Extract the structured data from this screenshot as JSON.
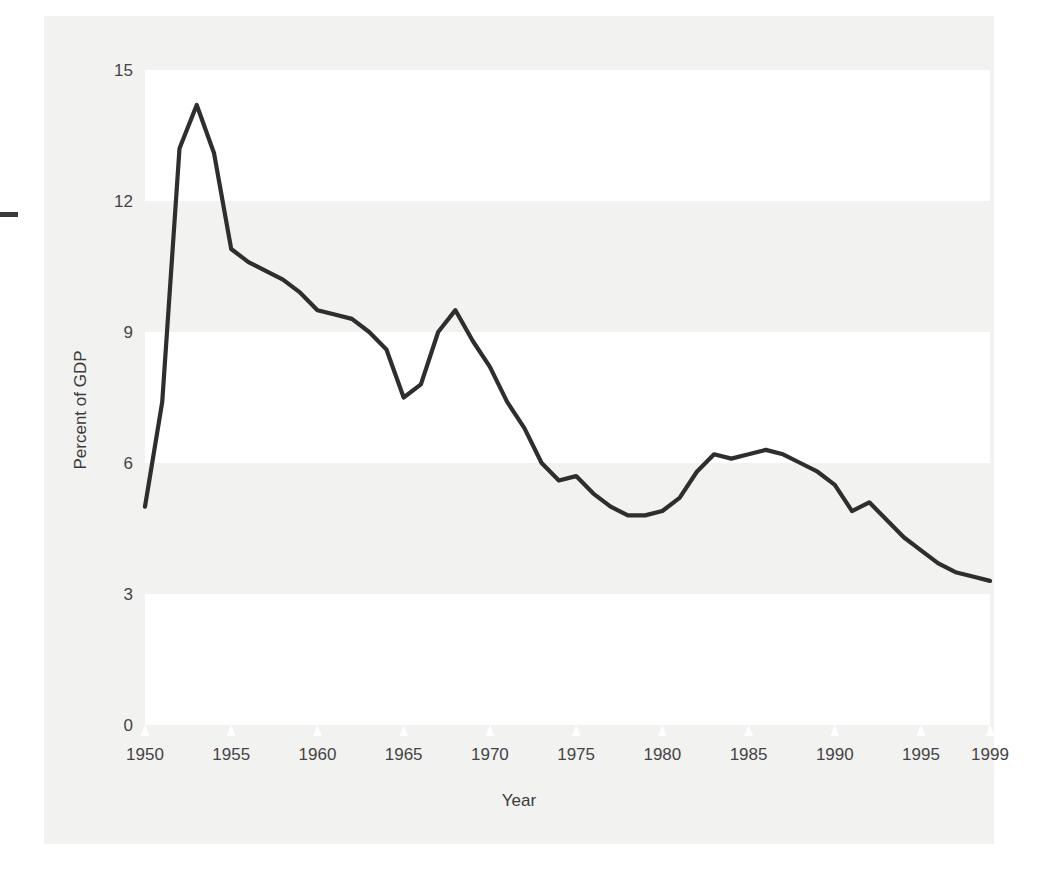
{
  "chart_data": {
    "type": "line",
    "title": "",
    "xlabel": "Year",
    "ylabel": "Percent of GDP",
    "xlim": [
      1950,
      1999
    ],
    "ylim": [
      0,
      15
    ],
    "ytick_values": [
      0,
      3,
      6,
      9,
      12,
      15
    ],
    "ytick_labels": [
      "0",
      "3",
      "6",
      "9",
      "12",
      "15"
    ],
    "xtick_values": [
      1950,
      1955,
      1960,
      1965,
      1970,
      1975,
      1980,
      1985,
      1990,
      1995,
      1999
    ],
    "xtick_labels": [
      "1950",
      "1955",
      "1960",
      "1965",
      "1970",
      "1975",
      "1980",
      "1985",
      "1990",
      "1995",
      "1999"
    ],
    "grid": false,
    "banded_background": true,
    "band_ranges": [
      [
        12,
        15
      ],
      [
        6,
        9
      ],
      [
        0,
        3
      ]
    ],
    "legend": null,
    "series": [
      {
        "name": "Defense spending as percent of GDP",
        "color": "#2e2e2e",
        "x": [
          1950,
          1951,
          1952,
          1953,
          1954,
          1955,
          1956,
          1957,
          1958,
          1959,
          1960,
          1961,
          1962,
          1963,
          1964,
          1965,
          1966,
          1967,
          1968,
          1969,
          1970,
          1971,
          1972,
          1973,
          1974,
          1975,
          1976,
          1977,
          1978,
          1979,
          1980,
          1981,
          1982,
          1983,
          1984,
          1985,
          1986,
          1987,
          1988,
          1989,
          1990,
          1991,
          1992,
          1993,
          1994,
          1995,
          1996,
          1997,
          1998,
          1999
        ],
        "values": [
          5.0,
          7.4,
          13.2,
          14.2,
          13.1,
          10.9,
          10.6,
          10.4,
          10.2,
          9.9,
          9.5,
          9.4,
          9.3,
          9.0,
          8.6,
          7.5,
          7.8,
          9.0,
          9.5,
          8.8,
          8.2,
          7.4,
          6.8,
          6.0,
          5.6,
          5.7,
          5.3,
          5.0,
          4.8,
          4.8,
          4.9,
          5.2,
          5.8,
          6.2,
          6.1,
          6.2,
          6.3,
          6.2,
          6.0,
          5.8,
          5.5,
          4.9,
          5.1,
          4.7,
          4.3,
          4.0,
          3.7,
          3.5,
          3.4,
          3.3
        ]
      }
    ]
  },
  "axis": {
    "y_title": "Percent of GDP",
    "x_title": "Year"
  }
}
